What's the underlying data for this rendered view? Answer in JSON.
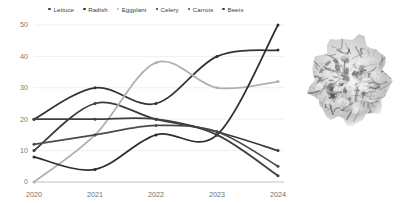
{
  "chart_data": {
    "type": "line",
    "title": "",
    "xlabel": "",
    "ylabel": "",
    "x": [
      "2020",
      "2021",
      "2022",
      "2023",
      "2024"
    ],
    "categories": [
      "2020",
      "2021",
      "2022",
      "2023",
      "2024"
    ],
    "ylim": [
      0,
      50
    ],
    "yticks": [
      0,
      10,
      20,
      30,
      40,
      50
    ],
    "grid": true,
    "legend_position": "top-center",
    "series": [
      {
        "name": "Lettuce",
        "values": [
          10,
          25,
          20,
          16,
          10
        ],
        "color": "#3b3b3b"
      },
      {
        "name": "Radish",
        "values": [
          20,
          30,
          25,
          40,
          42
        ],
        "color": "#333333"
      },
      {
        "name": "Eggplant",
        "values": [
          0,
          15,
          38,
          30,
          32
        ],
        "color": "#b0b0b0"
      },
      {
        "name": "Celery",
        "values": [
          8,
          4,
          15,
          15,
          50
        ],
        "color": "#2e2e2e"
      },
      {
        "name": "Carrots",
        "values": [
          12,
          15,
          18,
          16,
          5
        ],
        "color": "#4a4a4a"
      },
      {
        "name": "Beets",
        "values": [
          20,
          20,
          20,
          15,
          2
        ],
        "color": "#404040"
      }
    ]
  },
  "legend": {
    "items": [
      {
        "label": "Lettuce"
      },
      {
        "label": "Radish"
      },
      {
        "label": "Eggplant"
      },
      {
        "label": "Celery"
      },
      {
        "label": "Carrots"
      },
      {
        "label": "Beets"
      }
    ]
  },
  "axes": {
    "y_tick_labels": [
      "50",
      "40",
      "30",
      "20",
      "10",
      "0"
    ],
    "x_tick_labels": [
      "2020",
      "2021",
      "2022",
      "2023",
      "2024"
    ]
  },
  "photo": {
    "alt": "lettuce-head-photo"
  }
}
